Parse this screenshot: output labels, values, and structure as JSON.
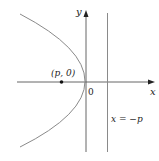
{
  "diagram": {
    "type": "parabola",
    "colors": {
      "axis": "#555555",
      "curve": "#8a8a8a",
      "directrix": "#8a8a8a",
      "text": "#222222",
      "point": "#111111"
    },
    "labels": {
      "y_axis": "y",
      "x_axis": "x",
      "origin": "0",
      "focus": "(p, 0)",
      "directrix": "x = −p"
    }
  }
}
